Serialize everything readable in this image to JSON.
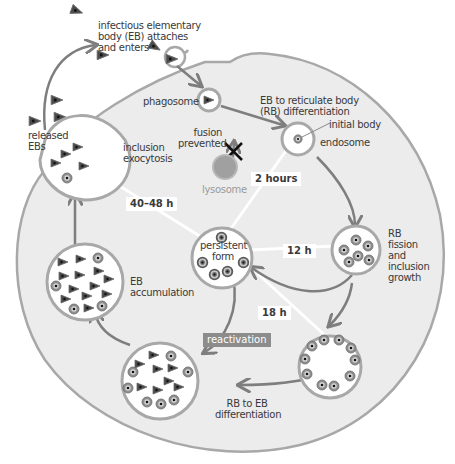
{
  "colors": {
    "background": "#ffffff",
    "cell_fill": "#ececec",
    "membrane": "#a8a8a8",
    "arrow": "#7e7e7e",
    "body_dark": "#4a4a4a",
    "lysosome": "#9a9a9a",
    "reactivation_bg": "#8c8c8c"
  },
  "labels": {
    "entry": [
      "infectious elementary",
      "body (EB) attaches",
      "and enters"
    ],
    "phagosome": "phagosome",
    "fusion_prevented": [
      "fusion",
      "prevented"
    ],
    "lysosome": "lysosome",
    "eb_to_rb": [
      "EB to reticulate body",
      "(RB) differentiation"
    ],
    "initial_body": "initial body",
    "endosome": "endosome",
    "rb_fission": [
      "RB",
      "fission",
      "and",
      "inclusion",
      "growth"
    ],
    "released_ebs": [
      "released",
      "EBs"
    ],
    "inclusion_exocytosis": [
      "inclusion",
      "exocytosis"
    ],
    "eb_accumulation": [
      "EB",
      "accumulation"
    ],
    "persistent_form": [
      "persistent",
      "form"
    ],
    "rb_to_eb": [
      "RB to EB",
      "differentiation"
    ],
    "reactivation": "reactivation"
  },
  "timepoints": {
    "t2": "2 hours",
    "t12": "12 h",
    "t18": "18 h",
    "t40": "40–48 h"
  },
  "stages": [
    {
      "name": "attachment and entry"
    },
    {
      "name": "phagosome"
    },
    {
      "name": "EB to RB differentiation",
      "time": "2 hours"
    },
    {
      "name": "RB fission and inclusion growth",
      "time": "12 h"
    },
    {
      "name": "RB to EB differentiation",
      "time": "18 h"
    },
    {
      "name": "EB accumulation"
    },
    {
      "name": "inclusion exocytosis",
      "time": "40–48 h"
    },
    {
      "name": "persistent form"
    }
  ]
}
